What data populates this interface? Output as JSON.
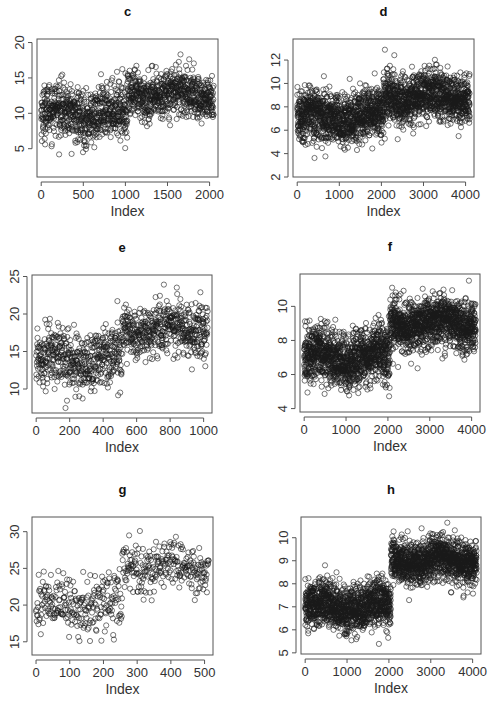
{
  "figure": {
    "background": "#ffffff",
    "point_color": "#1a1a1a",
    "axis_color": "#555555"
  },
  "chart_data": [
    {
      "id": "c",
      "type": "scatter",
      "title": "c",
      "xlabel": "Index",
      "ylabel": "",
      "n": 2050,
      "xlim": [
        -50,
        2100
      ],
      "ylim": [
        1,
        20.5
      ],
      "xticks": [
        0,
        500,
        1000,
        1500,
        2000
      ],
      "yticks": [
        5,
        10,
        15,
        20
      ],
      "segments": [
        {
          "from": 0,
          "to": 1024,
          "mean": 10,
          "sd": 2.2
        },
        {
          "from": 1025,
          "to": 2049,
          "mean": 12.7,
          "sd": 2.0
        }
      ],
      "box": {
        "left": 37,
        "top": 39,
        "right": 218,
        "bottom": 177
      },
      "point_count_drawn": 1400
    },
    {
      "id": "d",
      "type": "scatter",
      "title": "d",
      "xlabel": "Index",
      "ylabel": "",
      "n": 4100,
      "xlim": [
        -100,
        4200
      ],
      "ylim": [
        2,
        13.8
      ],
      "xticks": [
        0,
        1000,
        2000,
        3000,
        4000
      ],
      "yticks": [
        2,
        4,
        6,
        8,
        10,
        12
      ],
      "segments": [
        {
          "from": 0,
          "to": 2049,
          "mean": 7.1,
          "sd": 1.3
        },
        {
          "from": 2050,
          "to": 4099,
          "mean": 8.9,
          "sd": 1.2
        }
      ],
      "box": {
        "left": 293,
        "top": 39,
        "right": 474,
        "bottom": 177
      },
      "point_count_drawn": 2200
    },
    {
      "id": "e",
      "type": "scatter",
      "title": "e",
      "xlabel": "Index",
      "ylabel": "",
      "n": 1025,
      "xlim": [
        -25,
        1050
      ],
      "ylim": [
        6.8,
        25.2
      ],
      "xticks": [
        0,
        200,
        400,
        600,
        800,
        1000
      ],
      "yticks": [
        10,
        15,
        20,
        25
      ],
      "segments": [
        {
          "from": 0,
          "to": 511,
          "mean": 14,
          "sd": 2.4
        },
        {
          "from": 512,
          "to": 1024,
          "mean": 18,
          "sd": 2.0
        }
      ],
      "box": {
        "left": 32,
        "top": 275,
        "right": 212,
        "bottom": 413
      },
      "point_count_drawn": 1025
    },
    {
      "id": "f",
      "type": "scatter",
      "title": "f",
      "xlabel": "Index",
      "ylabel": "",
      "n": 4100,
      "xlim": [
        -100,
        4200
      ],
      "ylim": [
        3.8,
        11.9
      ],
      "xticks": [
        0,
        1000,
        2000,
        3000,
        4000
      ],
      "yticks": [
        4,
        6,
        8,
        10
      ],
      "segments": [
        {
          "from": 0,
          "to": 2049,
          "mean": 7.0,
          "sd": 1.0
        },
        {
          "from": 2050,
          "to": 4099,
          "mean": 9.0,
          "sd": 0.9
        }
      ],
      "box": {
        "left": 300,
        "top": 274,
        "right": 480,
        "bottom": 412
      },
      "point_count_drawn": 2400
    },
    {
      "id": "g",
      "type": "scatter",
      "title": "g",
      "xlabel": "Index",
      "ylabel": "",
      "n": 513,
      "xlim": [
        -12,
        525
      ],
      "ylim": [
        13.2,
        32
      ],
      "xticks": [
        0,
        100,
        200,
        300,
        400,
        500
      ],
      "yticks": [
        15,
        20,
        25,
        30
      ],
      "segments": [
        {
          "from": 0,
          "to": 255,
          "mean": 20,
          "sd": 2.3
        },
        {
          "from": 256,
          "to": 512,
          "mean": 25.3,
          "sd": 1.9
        }
      ],
      "box": {
        "left": 32,
        "top": 517,
        "right": 213,
        "bottom": 655
      },
      "point_count_drawn": 513
    },
    {
      "id": "h",
      "type": "scatter",
      "title": "h",
      "xlabel": "Index",
      "ylabel": "",
      "n": 4100,
      "xlim": [
        -100,
        4200
      ],
      "ylim": [
        4.95,
        10.9
      ],
      "xticks": [
        0,
        1000,
        2000,
        3000,
        4000
      ],
      "yticks": [
        5,
        6,
        7,
        8,
        9,
        10
      ],
      "segments": [
        {
          "from": 0,
          "to": 2049,
          "mean": 7.0,
          "sd": 0.6
        },
        {
          "from": 2050,
          "to": 4099,
          "mean": 9.0,
          "sd": 0.55
        }
      ],
      "box": {
        "left": 301,
        "top": 517,
        "right": 481,
        "bottom": 654
      },
      "point_count_drawn": 2400
    }
  ]
}
